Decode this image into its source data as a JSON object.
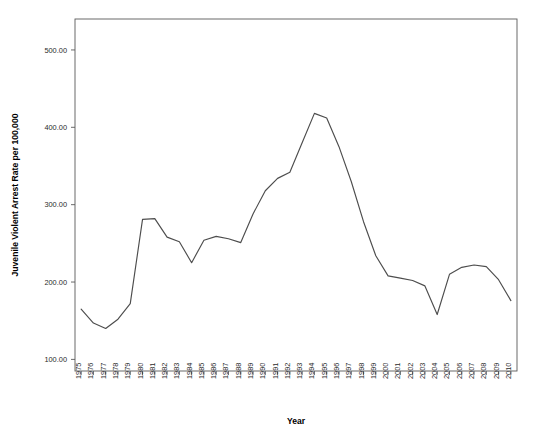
{
  "chart_data": {
    "type": "line",
    "title": "",
    "xlabel": "Year",
    "ylabel": "Juvenile Violent Arrest Rate per 100,000",
    "xlim": [
      1974.5,
      2010.5
    ],
    "ylim": [
      85,
      540
    ],
    "grid": false,
    "legend": null,
    "line_color": "#4d4d4d",
    "y_ticks": [
      100,
      200,
      300,
      400,
      500
    ],
    "y_tick_labels": [
      "100.00",
      "200.00",
      "300.00",
      "400.00",
      "500.00"
    ],
    "x_ticks": [
      1975,
      1976,
      1977,
      1978,
      1979,
      1980,
      1981,
      1982,
      1983,
      1984,
      1985,
      1986,
      1987,
      1988,
      1989,
      1990,
      1991,
      1992,
      1993,
      1994,
      1995,
      1996,
      1997,
      1998,
      1999,
      2000,
      2001,
      2002,
      2003,
      2004,
      2005,
      2006,
      2007,
      2008,
      2009,
      2010
    ],
    "x_tick_labels": [
      "1975",
      "1976",
      "1977",
      "1978",
      "1979",
      "1980",
      "1981",
      "1982",
      "1983",
      "1984",
      "1985",
      "1986",
      "1987",
      "1988",
      "1989",
      "1990",
      "1991",
      "1992",
      "1993",
      "1994",
      "1995",
      "1996",
      "1997",
      "1998",
      "1999",
      "2000",
      "2001",
      "2002",
      "2003",
      "2004",
      "2005",
      "2006",
      "2007",
      "2008",
      "2009",
      "2010"
    ],
    "categories": [
      1975,
      1976,
      1977,
      1978,
      1979,
      1980,
      1981,
      1982,
      1983,
      1984,
      1985,
      1986,
      1987,
      1988,
      1989,
      1990,
      1991,
      1992,
      1993,
      1994,
      1995,
      1996,
      1997,
      1998,
      1999,
      2000,
      2001,
      2002,
      2003,
      2004,
      2005,
      2006,
      2007,
      2008,
      2009,
      2010
    ],
    "values": [
      165,
      147,
      140,
      152,
      172,
      281,
      282,
      258,
      252,
      225,
      254,
      259,
      256,
      251,
      288,
      318,
      334,
      342,
      380,
      418,
      412,
      375,
      330,
      278,
      234,
      208,
      205,
      202,
      195,
      158,
      210,
      219,
      222,
      220,
      203,
      176
    ]
  },
  "axis": {
    "x_title": "Year",
    "y_title": "Juvenile Violent Arrest Rate per 100,000"
  }
}
